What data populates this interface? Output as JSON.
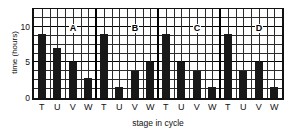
{
  "chart_data": {
    "type": "bar",
    "title": "",
    "xlabel": "stage in cycle",
    "ylabel": "time (hours)",
    "ylim": [
      0,
      12.5
    ],
    "yticks": [
      0,
      5,
      10
    ],
    "ytick_labels": [
      "0",
      "5",
      "10"
    ],
    "grid": true,
    "grid_y_step": 1.25,
    "legend": "none",
    "categories": [
      "T",
      "U",
      "V",
      "W"
    ],
    "group_labels": [
      "A",
      "B",
      "C",
      "D"
    ],
    "groups": [
      {
        "name": "A",
        "categories": [
          "T",
          "U",
          "V",
          "W"
        ],
        "values": [
          9,
          7,
          5,
          2.75
        ]
      },
      {
        "name": "B",
        "categories": [
          "T",
          "U",
          "V",
          "W"
        ],
        "values": [
          9,
          1.5,
          3.75,
          5
        ]
      },
      {
        "name": "C",
        "categories": [
          "T",
          "U",
          "V",
          "W"
        ],
        "values": [
          9,
          5,
          3.75,
          1.5
        ]
      },
      {
        "name": "D",
        "categories": [
          "T",
          "U",
          "V",
          "W"
        ],
        "values": [
          9,
          3.75,
          5,
          1.5
        ]
      }
    ],
    "series": [
      {
        "name": "T",
        "values": [
          9,
          9,
          9,
          9
        ]
      },
      {
        "name": "U",
        "values": [
          7,
          1.5,
          5,
          3.75
        ]
      },
      {
        "name": "V",
        "values": [
          5,
          3.75,
          3.75,
          5
        ]
      },
      {
        "name": "W",
        "values": [
          2.75,
          5,
          1.5,
          1.5
        ]
      }
    ],
    "bar_color": "#181818",
    "axis_color": "#111111"
  }
}
